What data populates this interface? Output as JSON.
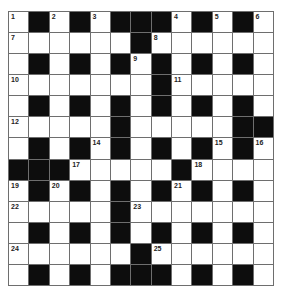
{
  "puzzle": {
    "rows": 13,
    "cols": 13,
    "colors": {
      "block": "#0d0d0d",
      "cell": "#ffffff",
      "line": "#6e6e6e",
      "number": "#222222"
    },
    "grid": [
      "W.W.W...W.W.W",
      "WWWWWW.WWWWWW",
      "W.W.W.W.W.W.W",
      "WWWWWWW.WWWWW",
      "W.W.W.W.W.W.W",
      "WWWWW.WWWWW...",
      "W.W.W.W.W.W.W",
      "...WWWWW.WWWW",
      "W.W.W.W.W.W.W",
      "WWWWW.WWWWWWW",
      "W.W.W.W.W.W.W",
      "WWWWWW.WWWWWW",
      "W.W.W...W.W.W"
    ],
    "numbers": [
      {
        "r": 0,
        "c": 0,
        "n": "1"
      },
      {
        "r": 0,
        "c": 2,
        "n": "2"
      },
      {
        "r": 0,
        "c": 4,
        "n": "3"
      },
      {
        "r": 0,
        "c": 8,
        "n": "4"
      },
      {
        "r": 0,
        "c": 10,
        "n": "5"
      },
      {
        "r": 0,
        "c": 12,
        "n": "6"
      },
      {
        "r": 1,
        "c": 0,
        "n": "7"
      },
      {
        "r": 1,
        "c": 7,
        "n": "8"
      },
      {
        "r": 2,
        "c": 6,
        "n": "9"
      },
      {
        "r": 3,
        "c": 0,
        "n": "10"
      },
      {
        "r": 3,
        "c": 8,
        "n": "11"
      },
      {
        "r": 5,
        "c": 0,
        "n": "12"
      },
      {
        "r": 5,
        "c": 5,
        "n": "13"
      },
      {
        "r": 6,
        "c": 4,
        "n": "14"
      },
      {
        "r": 6,
        "c": 10,
        "n": "15"
      },
      {
        "r": 6,
        "c": 12,
        "n": "16"
      },
      {
        "r": 7,
        "c": 3,
        "n": "17"
      },
      {
        "r": 7,
        "c": 9,
        "n": "18"
      },
      {
        "r": 8,
        "c": 0,
        "n": "19"
      },
      {
        "r": 8,
        "c": 2,
        "n": "20"
      },
      {
        "r": 8,
        "c": 8,
        "n": "21"
      },
      {
        "r": 9,
        "c": 0,
        "n": "22"
      },
      {
        "r": 9,
        "c": 6,
        "n": "23"
      },
      {
        "r": 11,
        "c": 0,
        "n": "24"
      },
      {
        "r": 11,
        "c": 7,
        "n": "25"
      }
    ]
  }
}
